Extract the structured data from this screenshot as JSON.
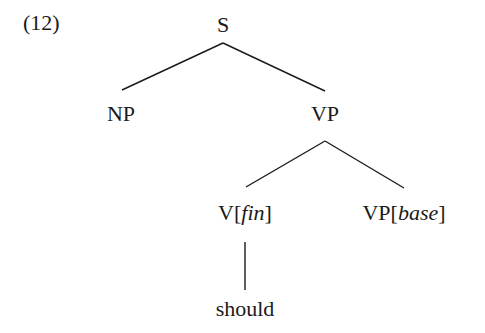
{
  "example_number": "(12)",
  "tree": {
    "root": {
      "label": "S"
    },
    "np": {
      "label": "NP"
    },
    "vp": {
      "label": "VP"
    },
    "v_fin": {
      "cat": "V",
      "open": "[",
      "feature": "fin",
      "close": "]"
    },
    "vp_base": {
      "cat": "VP",
      "open": "[",
      "feature": "base",
      "close": "]"
    },
    "leaf": {
      "label": "should"
    }
  },
  "colors": {
    "text": "#1a1a1a",
    "lines": "#1a1a1a",
    "background": "#ffffff"
  }
}
